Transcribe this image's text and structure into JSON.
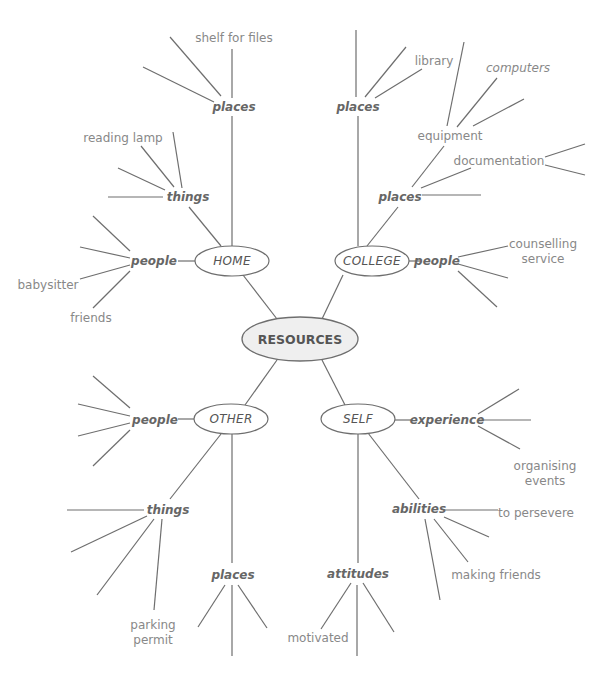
{
  "diagram": {
    "type": "mind-map",
    "center": {
      "label": "RESOURCES",
      "x": 300,
      "y": 339
    },
    "branches": [
      {
        "id": "home",
        "label": "HOME",
        "x": 232,
        "y": 261,
        "categories": [
          {
            "id": "home-places",
            "label": "places",
            "x": 233,
            "y": 107,
            "leaves": [
              {
                "label": "shelf for files",
                "x": 234,
                "y": 38
              }
            ]
          },
          {
            "id": "home-things",
            "label": "things",
            "x": 188,
            "y": 197,
            "leaves": [
              {
                "label": "reading lamp",
                "x": 123,
                "y": 138
              }
            ]
          },
          {
            "id": "home-people",
            "label": "people",
            "x": 154,
            "y": 261,
            "leaves": [
              {
                "label": "babysitter",
                "x": 48,
                "y": 285
              },
              {
                "label": "friends",
                "x": 91,
                "y": 318
              }
            ]
          }
        ]
      },
      {
        "id": "college",
        "label": "COLLEGE",
        "x": 372,
        "y": 261,
        "categories": [
          {
            "id": "college-places-top",
            "label": "places",
            "x": 358,
            "y": 107,
            "leaves": [
              {
                "label": "library",
                "x": 434,
                "y": 61
              }
            ]
          },
          {
            "id": "college-places",
            "label": "places",
            "x": 400,
            "y": 197,
            "leaves": [
              {
                "label": "equipment",
                "x": 450,
                "y": 136
              },
              {
                "label": "documentation",
                "x": 499,
                "y": 161
              },
              {
                "label": "computers",
                "x": 518,
                "y": 68,
                "italic": true
              }
            ]
          },
          {
            "id": "college-people",
            "label": "people",
            "x": 437,
            "y": 261,
            "leaves": [
              {
                "label": "counselling service",
                "x": 543,
                "y": 252
              }
            ]
          }
        ]
      },
      {
        "id": "other",
        "label": "OTHER",
        "x": 231,
        "y": 419,
        "categories": [
          {
            "id": "other-people",
            "label": "people",
            "x": 155,
            "y": 420,
            "leaves": []
          },
          {
            "id": "other-things",
            "label": "things",
            "x": 168,
            "y": 510,
            "leaves": [
              {
                "label": "parking permit",
                "x": 153,
                "y": 631
              }
            ]
          },
          {
            "id": "other-places",
            "label": "places",
            "x": 233,
            "y": 575,
            "leaves": []
          }
        ]
      },
      {
        "id": "self",
        "label": "SELF",
        "x": 358,
        "y": 419,
        "categories": [
          {
            "id": "self-experience",
            "label": "experience",
            "x": 447,
            "y": 420,
            "leaves": [
              {
                "label": "organising events",
                "x": 545,
                "y": 473
              }
            ]
          },
          {
            "id": "self-abilities",
            "label": "abilities",
            "x": 419,
            "y": 509,
            "leaves": [
              {
                "label": "to persevere",
                "x": 536,
                "y": 513
              },
              {
                "label": "making friends",
                "x": 496,
                "y": 575
              }
            ]
          },
          {
            "id": "self-attitudes",
            "label": "attitudes",
            "x": 358,
            "y": 574,
            "leaves": [
              {
                "label": "motivated",
                "x": 318,
                "y": 638
              }
            ]
          }
        ]
      }
    ]
  },
  "text": {
    "center": "RESOURCES",
    "home": "HOME",
    "college": "COLLEGE",
    "other": "OTHER",
    "self": "SELF",
    "places": "places",
    "things": "things",
    "people": "people",
    "experience": "experience",
    "abilities": "abilities",
    "attitudes": "attitudes",
    "shelf_for_files": "shelf for files",
    "reading_lamp": "reading lamp",
    "babysitter": "babysitter",
    "friends": "friends",
    "library": "library",
    "computers": "computers",
    "equipment": "equipment",
    "documentation": "documentation",
    "counselling": "counselling",
    "service": "service",
    "organising": "organising",
    "events": "events",
    "to_persevere": "to persevere",
    "making_friends": "making friends",
    "motivated": "motivated",
    "parking": "parking",
    "permit": "permit"
  },
  "colors": {
    "line": "#6e6e6e",
    "center_fill": "#efefef",
    "node_text": "#555555",
    "leaf_text": "#888888"
  }
}
